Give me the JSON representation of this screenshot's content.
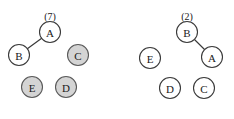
{
  "figure": {
    "background_color": "#ffffff",
    "node_fill_white": "#ffffff",
    "node_fill_gray": "#d4d4d4",
    "node_stroke_color": "#3a3a3a",
    "edge_color": "#3a3a3a",
    "node_radius": 10.5
  },
  "panels": [
    {
      "id": "left-panel",
      "count_label": "(7)",
      "count_label_pos": {
        "x": 50,
        "y": 16
      },
      "nodes": [
        {
          "id": "A",
          "label": "A",
          "x": 50,
          "y": 32,
          "fill": "white"
        },
        {
          "id": "B",
          "label": "B",
          "x": 19,
          "y": 55,
          "fill": "white"
        },
        {
          "id": "C",
          "label": "C",
          "x": 78,
          "y": 55,
          "fill": "gray"
        },
        {
          "id": "E",
          "label": "E",
          "x": 32,
          "y": 87,
          "fill": "gray"
        },
        {
          "id": "D",
          "label": "D",
          "x": 66,
          "y": 87,
          "fill": "gray"
        }
      ],
      "edges": [
        {
          "from": "A",
          "to": "B"
        }
      ]
    },
    {
      "id": "right-panel",
      "count_label": "(2)",
      "count_label_pos": {
        "x": 187,
        "y": 16
      },
      "nodes": [
        {
          "id": "B",
          "label": "B",
          "x": 187,
          "y": 32,
          "fill": "white"
        },
        {
          "id": "A",
          "label": "A",
          "x": 212,
          "y": 57,
          "fill": "white"
        },
        {
          "id": "E",
          "label": "E",
          "x": 150,
          "y": 58,
          "fill": "white"
        },
        {
          "id": "D",
          "label": "D",
          "x": 170,
          "y": 88,
          "fill": "white"
        },
        {
          "id": "C",
          "label": "C",
          "x": 204,
          "y": 88,
          "fill": "white"
        }
      ],
      "edges": [
        {
          "from": "B",
          "to": "A"
        }
      ]
    }
  ]
}
